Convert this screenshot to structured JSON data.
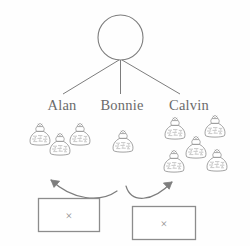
{
  "diagram": {
    "colors": {
      "stroke": "#7d7d7d",
      "bag_stroke": "#8a8a8a",
      "text": "#6b6b6b",
      "box_stroke": "#8c8c8c",
      "background": "#fefefe"
    },
    "root": {
      "shape": "circle",
      "label": ""
    },
    "children": [
      {
        "id": "alan",
        "label": "Alan",
        "bag_count": 3,
        "bags": [
          {
            "x": 40,
            "y": 134
          },
          {
            "x": 60,
            "y": 143
          },
          {
            "x": 80,
            "y": 134
          }
        ]
      },
      {
        "id": "bonnie",
        "label": "Bonnie",
        "bag_count": 1,
        "bags": [
          {
            "x": 123,
            "y": 141
          }
        ]
      },
      {
        "id": "calvin",
        "label": "Calvin",
        "bag_count": 5,
        "bags": [
          {
            "x": 175,
            "y": 128
          },
          {
            "x": 215,
            "y": 126
          },
          {
            "x": 196,
            "y": 146
          },
          {
            "x": 174,
            "y": 161
          },
          {
            "x": 217,
            "y": 160
          }
        ]
      }
    ],
    "boxes": [
      {
        "id": "left-box",
        "symbol": "×",
        "x": 38,
        "y": 198,
        "width": 62,
        "height": 34
      },
      {
        "id": "right-box",
        "symbol": "×",
        "x": 132,
        "y": 206,
        "width": 64,
        "height": 34
      }
    ],
    "arrows": [
      {
        "id": "arrow-to-alan",
        "from": "left-box",
        "to": "alan-bags",
        "direction": "up-left"
      },
      {
        "id": "arrow-to-calvin",
        "from": "right-box",
        "to": "calvin-bags",
        "direction": "up-right"
      }
    ]
  }
}
